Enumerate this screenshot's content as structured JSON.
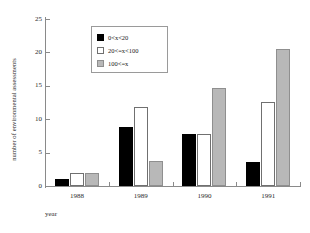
{
  "chart_data": {
    "type": "bar",
    "title": "",
    "subtitle": "",
    "xlabel": "year",
    "ylabel": "number of environmental assessments",
    "categories": [
      "1988",
      "1989",
      "1990",
      "1991"
    ],
    "series": [
      {
        "name": "0<x<20",
        "color": "#000000",
        "values": [
          1,
          8.8,
          7.8,
          3.6
        ]
      },
      {
        "name": "20<=x<100",
        "color": "#ffffff",
        "values": [
          2,
          11.8,
          7.8,
          12.6
        ]
      },
      {
        "name": "100<=x",
        "color": "#b8b8b8",
        "values": [
          2,
          3.8,
          14.7,
          20.5
        ]
      }
    ],
    "ylim": [
      0,
      25
    ],
    "yticks": [
      0,
      5,
      10,
      15,
      20,
      25
    ],
    "ytick_labels": [
      "0",
      "5",
      "10",
      "15",
      "20",
      "25"
    ],
    "grid": false,
    "legend_position": "upper-left-inside",
    "legend_entries": [
      "0<x<20",
      "20<=x<100",
      "100<=x"
    ]
  },
  "axes": {
    "y_title": "number of environmental assessments",
    "x_title": "year"
  }
}
